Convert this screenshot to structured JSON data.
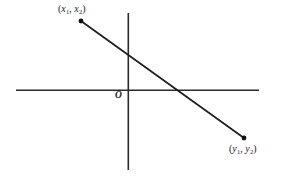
{
  "figure": {
    "background_color": "#ffffff",
    "stroke_color": "#2b2b2b",
    "width": 284,
    "height": 177
  },
  "labels": {
    "origin": "O",
    "point_upper_left": {
      "open_paren": "(",
      "var1": "x",
      "sub1": "1",
      "comma": ", ",
      "var2": "x",
      "sub2": "2",
      "close_paren": ")",
      "full_text": "(x1, x2)"
    },
    "point_lower_right": {
      "open_paren": "(",
      "var1": "y",
      "sub1": "1",
      "comma": ", ",
      "var2": "y",
      "sub2": "2",
      "close_paren": ")",
      "full_text": "(y1, y2)"
    }
  },
  "chart_data": {
    "type": "line",
    "title": "",
    "xlabel": "",
    "ylabel": "",
    "grid": false,
    "legend": null,
    "axes": {
      "x_axis": {
        "y_pixel": 90,
        "x_start_pixel": 16,
        "x_end_pixel": 259
      },
      "y_axis": {
        "x_pixel": 128,
        "y_start_pixel": 13,
        "y_end_pixel": 170
      },
      "origin_pixel": {
        "x": 128,
        "y": 90
      }
    },
    "series": [
      {
        "name": "segment",
        "points_pixel": [
          {
            "x": 81,
            "y": 21,
            "label": "(x1, x2)"
          },
          {
            "x": 244,
            "y": 138,
            "label": "(y1, y2)"
          }
        ],
        "markers": "filled-dot",
        "x_intercept_pixel": {
          "x": 178,
          "y": 90
        }
      }
    ],
    "annotations": [
      {
        "text": "(x1, x2)",
        "at_pixel": {
          "x": 58,
          "y": 4
        }
      },
      {
        "text": "O",
        "at_pixel": {
          "x": 115,
          "y": 91
        }
      },
      {
        "text": "(y1, y2)",
        "at_pixel": {
          "x": 229,
          "y": 144
        }
      }
    ]
  }
}
